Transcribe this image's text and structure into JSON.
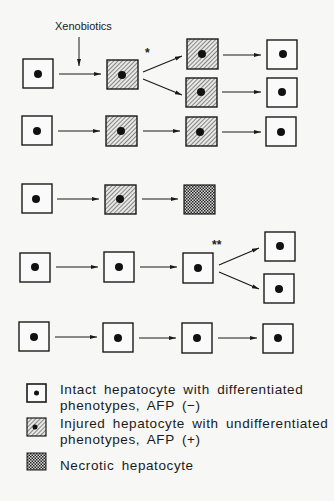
{
  "diagram": {
    "input_label": "Xenobiotics",
    "branch_mark_1": "*",
    "branch_mark_2": "**",
    "colors": {
      "stroke": "#1a1a1a",
      "background": "#f7f7f5",
      "nucleus": "#111111"
    },
    "rows": [
      {
        "id": "row-1",
        "description": "Intact -> (Xenobiotics) -> Injured -> * branch -> Injured x2 -> Intact x2",
        "cells": [
          "intact",
          "injured",
          [
            "injured",
            "injured"
          ],
          [
            "intact",
            "intact"
          ]
        ]
      },
      {
        "id": "row-2",
        "cells": [
          "intact",
          "injured",
          "injured",
          "intact"
        ]
      },
      {
        "id": "row-3",
        "cells": [
          "intact",
          "injured",
          "necrotic"
        ]
      },
      {
        "id": "row-4",
        "description": "Intact -> Intact -> Intact -> ** branch -> Intact x2",
        "cells": [
          "intact",
          "intact",
          "intact",
          [
            "intact",
            "intact"
          ]
        ]
      },
      {
        "id": "row-5",
        "cells": [
          "intact",
          "intact",
          "intact",
          "intact"
        ]
      }
    ]
  },
  "legend": {
    "items": [
      {
        "icon": "intact-hepatocyte-icon",
        "line1": "Intact hepatocyte with differentiated",
        "line2": "phenotypes, AFP (−)"
      },
      {
        "icon": "injured-hepatocyte-icon",
        "line1": "Injured hepatocyte with undifferentiated",
        "line2": "phenotypes, AFP (+)"
      },
      {
        "icon": "necrotic-hepatocyte-icon",
        "line1": "Necrotic hepatocyte",
        "line2": ""
      }
    ]
  }
}
